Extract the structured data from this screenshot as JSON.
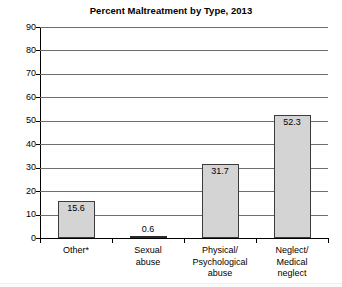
{
  "chart_data": {
    "type": "bar",
    "title": "Percent Maltreatment by Type, 2013",
    "xlabel": "",
    "ylabel": "",
    "ylim": [
      0,
      90
    ],
    "ytick_step": 10,
    "yticks": [
      "90",
      "80",
      "70",
      "60",
      "50",
      "40",
      "30",
      "20",
      "10",
      "0"
    ],
    "grid": true,
    "legend": false,
    "categories": [
      "Other*",
      "Sexual abuse",
      "Physical/ Psychological abuse",
      "Neglect/ Medical neglect"
    ],
    "category_lines": [
      [
        "Other*"
      ],
      [
        "Sexual",
        "abuse"
      ],
      [
        "Physical/",
        "Psychological",
        "abuse"
      ],
      [
        "Neglect/",
        "Medical",
        "neglect"
      ]
    ],
    "values": [
      15.6,
      31.7,
      52.3,
      0.6
    ],
    "bars": [
      {
        "label": "Other*",
        "value": 15.6,
        "value_label": "15.6"
      },
      {
        "label": "Sexual abuse",
        "value": 0.6,
        "value_label": "0.6"
      },
      {
        "label": "Physical/ Psychological abuse",
        "value": 31.7,
        "value_label": "31.7"
      },
      {
        "label": "Neglect/ Medical neglect",
        "value": 52.3,
        "value_label": "52.3"
      }
    ],
    "colors": {
      "bar_fill": "#d4d4d4",
      "bar_border": "#3c3c3c",
      "gridline": "#6e6e6e",
      "axis": "#000000",
      "text": "#000000",
      "background": "#ffffff"
    }
  }
}
